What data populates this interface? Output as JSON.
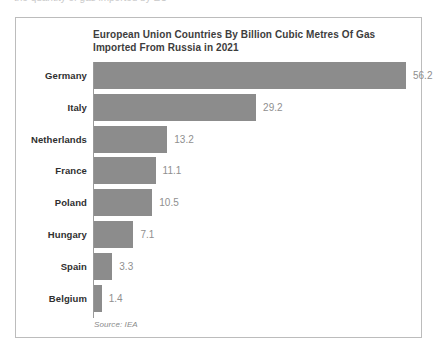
{
  "page": {
    "clipped_top_text": "the quantity of gas imported by EU"
  },
  "card": {
    "title": "European Union Countries By Billion Cubic Metres Of Gas Imported From Russia in 2021",
    "source_note": "Source: IEA"
  },
  "colors": {
    "bar": "#8c8c8c",
    "card_border": "#bcbcbc",
    "axis_line": "#9a9a9a",
    "title_text": "#3d3d3d",
    "category_text": "#2f2f2f",
    "value_text": "#8f8f8f",
    "background": "#ffffff"
  },
  "chart_data": {
    "type": "bar",
    "orientation": "horizontal",
    "title": "European Union Countries By Billion Cubic Metres Of Gas Imported From Russia in 2021",
    "xlabel": "",
    "ylabel": "",
    "categories": [
      "Germany",
      "Italy",
      "Netherlands",
      "France",
      "Poland",
      "Hungary",
      "Spain",
      "Belgium"
    ],
    "values": [
      56.2,
      29.2,
      13.2,
      11.1,
      10.5,
      7.1,
      3.3,
      1.4
    ],
    "value_labels": [
      "56.2",
      "29.2",
      "13.2",
      "11.1",
      "10.5",
      "7.1",
      "3.3",
      "1.4"
    ],
    "units": "billion cubic metres",
    "xlim": [
      0,
      56.2
    ],
    "grid": false,
    "legend": false,
    "source": "Source: IEA"
  }
}
